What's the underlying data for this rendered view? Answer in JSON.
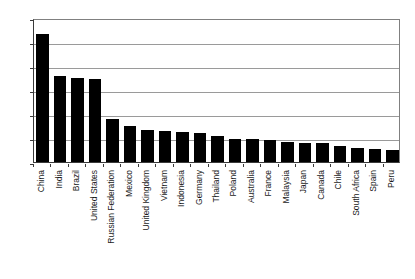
{
  "chart_data": {
    "type": "bar",
    "title": "",
    "subtitle": "",
    "xlabel": "",
    "ylabel": "",
    "ylim": [
      0,
      120
    ],
    "yticks": [
      0,
      20,
      40,
      60,
      80,
      100,
      120
    ],
    "grid": true,
    "legend": "none",
    "bar_color": "#000000",
    "categories": [
      "China",
      "India",
      "Brazil",
      "United States",
      "Russian Federation",
      "Mexico",
      "United Kingdom",
      "Vietnam",
      "Indonesia",
      "Germany",
      "Thailand",
      "Poland",
      "Australia",
      "France",
      "Malaysia",
      "Japan",
      "Canada",
      "Chile",
      "South Africa",
      "Spain",
      "Peru"
    ],
    "values": [
      107,
      72,
      70,
      69,
      36,
      30,
      27,
      26,
      25,
      24,
      22,
      19,
      19,
      18,
      17,
      16,
      16,
      13,
      12,
      11,
      10
    ]
  }
}
